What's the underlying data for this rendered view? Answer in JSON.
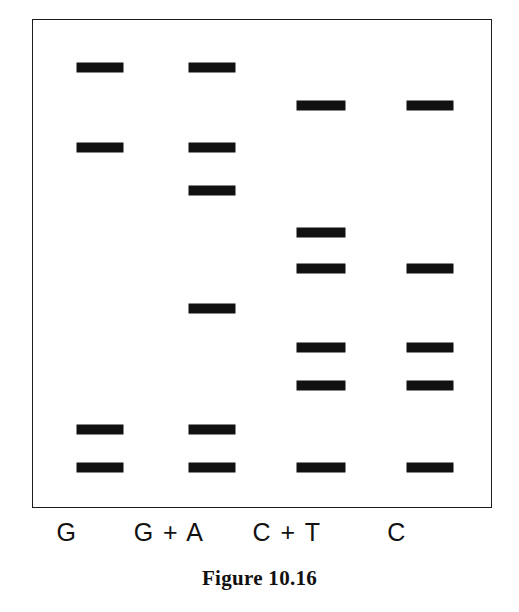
{
  "figure": {
    "caption": "Figure 10.16",
    "band_color": "#111111",
    "border_color": "#1c1c1c",
    "background_color": "#ffffff"
  },
  "plate": {
    "left": 32,
    "top": 19,
    "width": 460,
    "height": 489
  },
  "lanes": [
    {
      "id": "lane-g",
      "label": "G",
      "label_center_x": 67,
      "band_left": 76,
      "band_width": 46
    },
    {
      "id": "lane-ga",
      "label": "G + A",
      "label_center_x": 169,
      "band_left": 188,
      "band_width": 46
    },
    {
      "id": "lane-ct",
      "label": "C + T",
      "label_center_x": 287,
      "band_left": 296,
      "band_width": 48
    },
    {
      "id": "lane-c",
      "label": "C",
      "label_center_x": 397,
      "band_left": 406,
      "band_width": 46
    }
  ],
  "chart_data": {
    "type": "table",
    "title": "Figure 10.16",
    "subtitle": "DNA sequencing gel — Maxam-Gilbert chemical cleavage ladder",
    "xlabel": "Cleavage reaction lane",
    "ylabel": "Fragment migration (top = largest, bottom = smallest)",
    "categories": [
      "G",
      "G + A",
      "C + T",
      "C"
    ],
    "legend": [],
    "grid": false,
    "band_height_px": 9,
    "rows": [
      {
        "row": 1,
        "y": 62,
        "base": "G",
        "lanes": [
          "G",
          "G + A"
        ]
      },
      {
        "row": 2,
        "y": 100,
        "base": "C",
        "lanes": [
          "C + T",
          "C"
        ]
      },
      {
        "row": 3,
        "y": 142,
        "base": "G",
        "lanes": [
          "G",
          "G + A"
        ]
      },
      {
        "row": 4,
        "y": 185,
        "base": "A",
        "lanes": [
          "G + A"
        ]
      },
      {
        "row": 5,
        "y": 227,
        "base": "T",
        "lanes": [
          "C + T"
        ]
      },
      {
        "row": 6,
        "y": 263,
        "base": "C",
        "lanes": [
          "C + T",
          "C"
        ]
      },
      {
        "row": 7,
        "y": 303,
        "base": "A",
        "lanes": [
          "G + A"
        ]
      },
      {
        "row": 8,
        "y": 342,
        "base": "C",
        "lanes": [
          "C + T",
          "C"
        ]
      },
      {
        "row": 9,
        "y": 380,
        "base": "C",
        "lanes": [
          "C + T",
          "C"
        ]
      },
      {
        "row": 10,
        "y": 424,
        "base": "G",
        "lanes": [
          "G",
          "G + A"
        ]
      },
      {
        "row": 11,
        "y": 462,
        "base": "G",
        "lanes": [
          "G",
          "G + A",
          "C + T",
          "C"
        ]
      }
    ],
    "bands": [
      {
        "lane": "G",
        "y": 62,
        "x": 76,
        "w": 46
      },
      {
        "lane": "G + A",
        "y": 62,
        "x": 188,
        "w": 46
      },
      {
        "lane": "C + T",
        "y": 100,
        "x": 296,
        "w": 48
      },
      {
        "lane": "C",
        "y": 100,
        "x": 406,
        "w": 46
      },
      {
        "lane": "G",
        "y": 142,
        "x": 76,
        "w": 46
      },
      {
        "lane": "G + A",
        "y": 142,
        "x": 188,
        "w": 46
      },
      {
        "lane": "G + A",
        "y": 185,
        "x": 188,
        "w": 46
      },
      {
        "lane": "C + T",
        "y": 227,
        "x": 296,
        "w": 48
      },
      {
        "lane": "C + T",
        "y": 263,
        "x": 296,
        "w": 48
      },
      {
        "lane": "C",
        "y": 263,
        "x": 406,
        "w": 46
      },
      {
        "lane": "G + A",
        "y": 303,
        "x": 188,
        "w": 46
      },
      {
        "lane": "C + T",
        "y": 342,
        "x": 296,
        "w": 48
      },
      {
        "lane": "C",
        "y": 342,
        "x": 406,
        "w": 46
      },
      {
        "lane": "C + T",
        "y": 380,
        "x": 296,
        "w": 48
      },
      {
        "lane": "C",
        "y": 380,
        "x": 406,
        "w": 46
      },
      {
        "lane": "G",
        "y": 424,
        "x": 76,
        "w": 46
      },
      {
        "lane": "G + A",
        "y": 424,
        "x": 188,
        "w": 46
      },
      {
        "lane": "G",
        "y": 462,
        "x": 76,
        "w": 46
      },
      {
        "lane": "G + A",
        "y": 462,
        "x": 188,
        "w": 46
      },
      {
        "lane": "C + T",
        "y": 462,
        "x": 296,
        "w": 48
      },
      {
        "lane": "C",
        "y": 462,
        "x": 406,
        "w": 46
      }
    ]
  }
}
